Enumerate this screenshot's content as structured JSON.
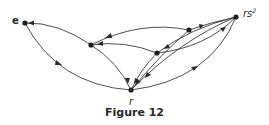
{
  "figure": {
    "caption": "Figure 12",
    "nodes": [
      {
        "id": "e",
        "label": "e",
        "x": 25,
        "y": 23
      },
      {
        "id": "a",
        "label": "",
        "x": 91,
        "y": 45
      },
      {
        "id": "b",
        "label": "",
        "x": 189,
        "y": 30
      },
      {
        "id": "c",
        "label": "",
        "x": 157,
        "y": 53
      },
      {
        "id": "rs2",
        "label": "rs",
        "label_sup": "2",
        "x": 236,
        "y": 17
      },
      {
        "id": "r",
        "label": "r",
        "x": 131,
        "y": 90
      }
    ],
    "edges": [
      {
        "from": "a",
        "to": "e"
      },
      {
        "from": "e",
        "to": "r"
      },
      {
        "from": "a",
        "to": "r"
      },
      {
        "from": "b",
        "to": "a"
      },
      {
        "from": "c",
        "to": "a"
      },
      {
        "from": "b",
        "to": "rs2"
      },
      {
        "from": "c",
        "to": "rs2"
      },
      {
        "from": "rs2",
        "to": "c"
      },
      {
        "from": "b",
        "to": "r"
      },
      {
        "from": "r",
        "to": "rs2"
      },
      {
        "from": "rs2",
        "to": "r"
      }
    ],
    "colors": {
      "ink": "#2a2a2a",
      "background": "#ffffff"
    }
  }
}
